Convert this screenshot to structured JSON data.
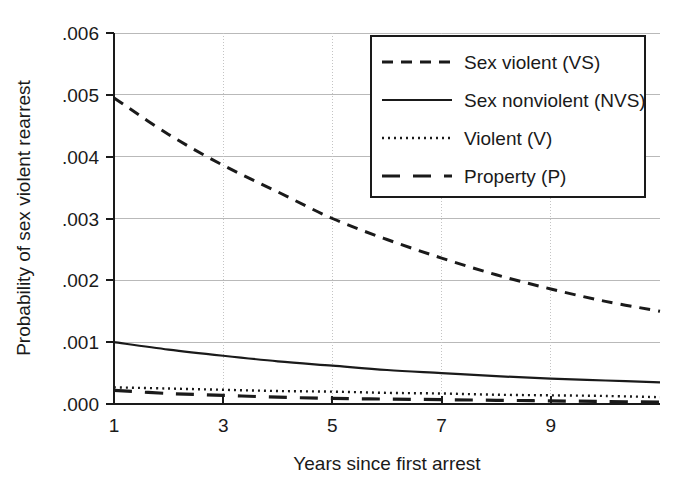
{
  "chart_data": {
    "type": "line",
    "title": "",
    "xlabel": "Years since first arrest",
    "ylabel": "Probability of sex violent rearrest",
    "xlim": [
      1,
      11
    ],
    "ylim": [
      0.0,
      0.006
    ],
    "grid": true,
    "legend_position": "top-right",
    "xticks": [
      1,
      3,
      5,
      7,
      9
    ],
    "xtick_labels": [
      "1",
      "3",
      "5",
      "7",
      "9"
    ],
    "yticks": [
      0.0,
      0.001,
      0.002,
      0.003,
      0.004,
      0.005,
      0.006
    ],
    "ytick_labels": [
      ".000",
      ".001",
      ".002",
      ".003",
      ".004",
      ".005",
      ".006"
    ],
    "x": [
      1,
      2,
      3,
      4,
      5,
      6,
      7,
      8,
      9,
      10,
      11
    ],
    "series": [
      {
        "name": "Sex violent (VS)",
        "style": "dashed",
        "values": [
          0.00495,
          0.00436,
          0.00386,
          0.00343,
          0.003,
          0.00266,
          0.00236,
          0.00209,
          0.00186,
          0.00166,
          0.0015
        ]
      },
      {
        "name": "Sex nonviolent (NVS)",
        "style": "solid",
        "values": [
          0.001,
          0.00088,
          0.00078,
          0.00069,
          0.00062,
          0.00055,
          0.0005,
          0.00045,
          0.00041,
          0.00038,
          0.00035
        ]
      },
      {
        "name": "Violent (V)",
        "style": "dotted",
        "values": [
          0.00027,
          0.00025,
          0.00023,
          0.00021,
          0.0002,
          0.00018,
          0.00017,
          0.00015,
          0.00014,
          0.00013,
          0.00011
        ]
      },
      {
        "name": "Property (P)",
        "style": "longdash",
        "values": [
          0.00022,
          0.00017,
          0.00014,
          0.00011,
          9e-05,
          8e-05,
          7e-05,
          6e-05,
          5e-05,
          4e-05,
          3e-05
        ]
      }
    ]
  },
  "legend": {
    "entries": [
      {
        "label": "Sex violent (VS)",
        "style": "dashed"
      },
      {
        "label": "Sex nonviolent (NVS)",
        "style": "solid"
      },
      {
        "label": "Violent (V)",
        "style": "dotted"
      },
      {
        "label": "Property (P)",
        "style": "longdash"
      }
    ]
  },
  "colors": {
    "line": "#1a1a1a",
    "grid": "#b9b9b9",
    "background": "#ffffff"
  }
}
